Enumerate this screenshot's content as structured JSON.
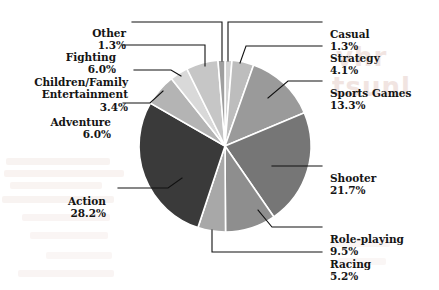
{
  "chart_data": {
    "type": "pie",
    "title": "",
    "subtitle": "",
    "xlabel": "",
    "ylabel": "",
    "legend_position": "none",
    "labels_position": "outside-with-leader-lines",
    "grid": false,
    "start_angle_deg": 0,
    "direction": "clockwise",
    "units": "percent",
    "categories": [
      "Casual",
      "Strategy",
      "Sports Games",
      "Shooter",
      "Role-playing",
      "Racing",
      "Action",
      "Adventure",
      "Children/Family Entertainment",
      "Fighting",
      "Other"
    ],
    "values": [
      1.3,
      4.1,
      13.3,
      21.7,
      9.5,
      5.2,
      28.2,
      6.0,
      3.4,
      6.0,
      1.3
    ],
    "value_labels": [
      "1.3%",
      "4.1%",
      "13.3%",
      "21.7%",
      "9.5%",
      "5.2%",
      "28.2%",
      "6.0%",
      "3.4%",
      "6.0%",
      "1.3%"
    ],
    "slice_colors": [
      "#d2d2d2",
      "#bdbdbd",
      "#9a9a9a",
      "#767676",
      "#8e8e8e",
      "#a8a8a8",
      "#3a3a3a",
      "#b4b4b4",
      "#d9d9d9",
      "#c6c6c6",
      "#9f9f9f"
    ],
    "slice_separator_color": "#ffffff",
    "background_color": "#ffffff",
    "text_color": "#141414",
    "leader_line_color": "#111111"
  },
  "labels": {
    "other": {
      "name": "Other",
      "pct": "1.3%"
    },
    "fighting": {
      "name": "Fighting",
      "pct": "6.0%"
    },
    "children_family": {
      "name": "Children/Family\nEntertainment",
      "pct": "3.4%"
    },
    "adventure": {
      "name": "Adventure",
      "pct": "6.0%"
    },
    "action": {
      "name": "Action",
      "pct": "28.2%"
    },
    "casual": {
      "name": "Casual",
      "pct": "1.3%"
    },
    "strategy": {
      "name": "Strategy",
      "pct": "4.1%"
    },
    "sports_games": {
      "name": "Sports Games",
      "pct": "13.3%"
    },
    "shooter": {
      "name": "Shooter",
      "pct": "21.7%"
    },
    "role_playing": {
      "name": "Role-playing",
      "pct": "9.5%"
    },
    "racing": {
      "name": "Racing",
      "pct": "5.2%"
    }
  },
  "watermark": {
    "visible": true,
    "color": "#e8d3cd"
  }
}
